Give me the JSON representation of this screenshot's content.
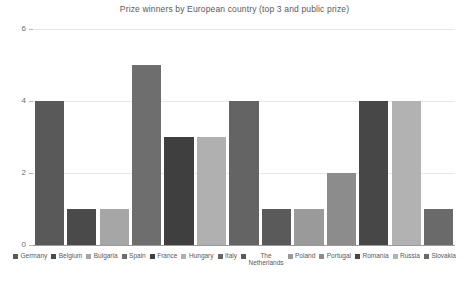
{
  "chart_data": {
    "type": "bar",
    "title": "Prize winners by European country (top 3 and public prize)",
    "xlabel": "",
    "ylabel": "",
    "ylim": [
      0,
      6
    ],
    "yticks": [
      0,
      2,
      4,
      6
    ],
    "ytick_labels": [
      "0",
      "2",
      "4",
      "6"
    ],
    "grid": true,
    "legend_position": "bottom",
    "categories": [
      "Germany",
      "Belgium",
      "Bulgaria",
      "Spain",
      "France",
      "Hungary",
      "Italy",
      "The Netherlands",
      "Poland",
      "Portugal",
      "Romania",
      "Russia",
      "Slovakia"
    ],
    "values": [
      4,
      1,
      1,
      5,
      3,
      3,
      4,
      1,
      1,
      2,
      4,
      4,
      1
    ],
    "colors": [
      "#595959",
      "#4a4a4a",
      "#a6a6a6",
      "#6e6e6e",
      "#3f3f3f",
      "#b0b0b0",
      "#646464",
      "#5a5a5a",
      "#9a9a9a",
      "#8c8c8c",
      "#474747",
      "#b2b2b2",
      "#6a6a6a"
    ]
  },
  "legend": {
    "items": [
      {
        "label": "Germany",
        "color": "#595959"
      },
      {
        "label": "Belgium",
        "color": "#4a4a4a"
      },
      {
        "label": "Bulgaria",
        "color": "#a6a6a6"
      },
      {
        "label": "Spain",
        "color": "#6e6e6e"
      },
      {
        "label": "France",
        "color": "#3f3f3f"
      },
      {
        "label": "Hungary",
        "color": "#b0b0b0"
      },
      {
        "label": "Italy",
        "color": "#646464"
      },
      {
        "label": "The\nNetherlands",
        "color": "#5a5a5a"
      },
      {
        "label": "Poland",
        "color": "#9a9a9a"
      },
      {
        "label": "Portugal",
        "color": "#8c8c8c"
      },
      {
        "label": "Romania",
        "color": "#474747"
      },
      {
        "label": "Russia",
        "color": "#b2b2b2"
      },
      {
        "label": "Slovakia",
        "color": "#6a6a6a"
      }
    ]
  },
  "style": {
    "grid_color": "#e8e8ea",
    "axis_color": "#9a9a9e",
    "text_color": "#58595b",
    "background": "#ffffff"
  }
}
